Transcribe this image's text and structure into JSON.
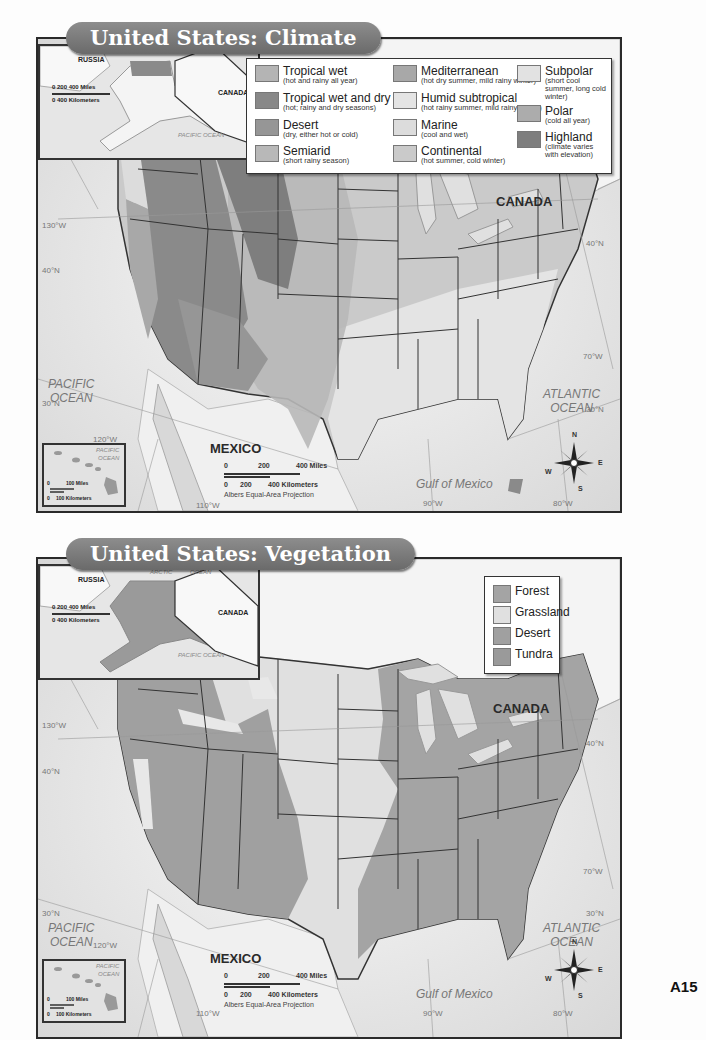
{
  "climate_map": {
    "title": "United States: Climate",
    "legend": [
      {
        "label": "Tropical wet",
        "desc": "(hot and rainy all year)",
        "color": "#b4b4b4"
      },
      {
        "label": "Tropical wet and dry",
        "desc": "(hot; rainy and dry seasons)",
        "color": "#888888"
      },
      {
        "label": "Desert",
        "desc": "(dry, either hot or cold)",
        "color": "#969696"
      },
      {
        "label": "Semiarid",
        "desc": "(short rainy season)",
        "color": "#b8b8b8"
      },
      {
        "label": "Mediterranean",
        "desc": "(hot dry summer, mild rainy winter)",
        "color": "#a8a8a8"
      },
      {
        "label": "Humid subtropical",
        "desc": "(hot rainy summer, mild rainy winter)",
        "color": "#e4e4e4"
      },
      {
        "label": "Marine",
        "desc": "(cool and wet)",
        "color": "#dcdcdc"
      },
      {
        "label": "Continental",
        "desc": "(hot summer, cold winter)",
        "color": "#cacaca"
      },
      {
        "label": "Subpolar",
        "desc": "(short cool summer, long cold winter)",
        "color": "#e2e2e2"
      },
      {
        "label": "Polar",
        "desc": "(cold all year)",
        "color": "#acacac"
      },
      {
        "label": "Highland",
        "desc": "(climate varies with elevation)",
        "color": "#7e7e7e"
      }
    ],
    "labels": {
      "canada": "CANADA",
      "mexico": "MEXICO",
      "pacific": "PACIFIC\nOCEAN",
      "atlantic": "ATLANTIC\nOCEAN",
      "gulf": "Gulf of Mexico",
      "lake_superior": "Lake Superior",
      "lake_michigan": "Lake Michigan",
      "lake_huron": "Lake Huron",
      "lake_ontario": "Lake Ontario",
      "lake_erie": "Lake Erie"
    },
    "gridlines": {
      "lon130": "130°W",
      "lat40w": "40°N",
      "lat40e": "40°N",
      "lon70": "70°W",
      "lat30w": "30°N",
      "lat30e": "30°N",
      "lon120": "120°W",
      "lon110": "110°W",
      "lon90": "90°W",
      "lon80": "80°W"
    },
    "scale": {
      "miles_0": "0",
      "miles_200": "200",
      "miles_400": "400 Miles",
      "km_0": "0",
      "km_200": "200",
      "km_400": "400 Kilometers"
    },
    "projection": "Albers Equal-Area Projection",
    "alaska_inset": {
      "russia": "RUSSIA",
      "canada": "CANADA",
      "arctic": "ARCTIC",
      "ocean": "OCEAN",
      "pacific": "PACIFIC OCEAN",
      "miles": "0  200  400 Miles",
      "km": "0     400 Kilometers"
    },
    "hawaii_inset": {
      "pacific": "PACIFIC",
      "ocean": "OCEAN",
      "miles": "100 Miles",
      "km": "100 Kilometers",
      "zero_m": "0",
      "zero_k": "0"
    },
    "compass": {
      "n": "N",
      "s": "S",
      "e": "E",
      "w": "W"
    }
  },
  "vegetation_map": {
    "title": "United States: Vegetation",
    "legend": [
      {
        "label": "Forest",
        "color": "#a4a4a4"
      },
      {
        "label": "Grassland",
        "color": "#e0e0e0"
      },
      {
        "label": "Desert",
        "color": "#a0a0a0"
      },
      {
        "label": "Tundra",
        "color": "#9a9a9a"
      }
    ],
    "labels": {
      "canada": "CANADA",
      "mexico": "MEXICO",
      "pacific": "PACIFIC\nOCEAN",
      "atlantic": "ATLANTIC\nOCEAN",
      "gulf": "Gulf of Mexico"
    },
    "gridlines": {
      "lon130": "130°W",
      "lat40w": "40°N",
      "lat40e": "40°N",
      "lon70": "70°W",
      "lat30w": "30°N",
      "lat30e": "30°N",
      "lon120": "120°W",
      "lon110": "110°W",
      "lon90": "90°W",
      "lon80": "80°W"
    },
    "scale": {
      "miles_0": "0",
      "miles_200": "200",
      "miles_400": "400 Miles",
      "km_0": "0",
      "km_200": "200",
      "km_400": "400 Kilometers"
    },
    "projection": "Albers Equal-Area Projection",
    "alaska_inset": {
      "russia": "RUSSIA",
      "canada": "CANADA",
      "arctic": "ARCTIC",
      "ocean": "OCEAN",
      "pacific": "PACIFIC OCEAN",
      "miles": "0  200  400 Miles",
      "km": "0     400 Kilometers"
    },
    "hawaii_inset": {
      "pacific": "PACIFIC",
      "ocean": "OCEAN",
      "miles": "100 Miles",
      "km": "100 Kilometers",
      "zero_m": "0",
      "zero_k": "0"
    },
    "compass": {
      "n": "N",
      "s": "S",
      "e": "E",
      "w": "W"
    }
  },
  "page_number": "A15"
}
